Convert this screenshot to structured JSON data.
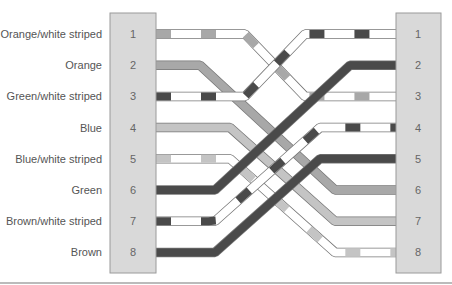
{
  "diagram": {
    "colors": {
      "connector_fill": "#d9d9d9",
      "connector_stroke": "#9a9a9a",
      "outline": "#777777",
      "white": "#ffffff",
      "orange": "#a8a8a8",
      "blue": "#c4c4c4",
      "green": "#4a4a4a",
      "brown": "#4a4a4a",
      "baseline": "#bbbbbb"
    },
    "left_labels": [
      "Orange/white striped",
      "Orange",
      "Green/white striped",
      "Blue",
      "Blue/white striped",
      "Green",
      "Brown/white striped",
      "Brown"
    ],
    "left_pins": [
      "1",
      "2",
      "3",
      "4",
      "5",
      "6",
      "7",
      "8"
    ],
    "right_pins": [
      "1",
      "2",
      "3",
      "4",
      "5",
      "6",
      "7",
      "8"
    ],
    "wires": [
      {
        "name": "Orange/white striped",
        "from": 1,
        "to": 3,
        "color": "orange",
        "striped": true
      },
      {
        "name": "Orange",
        "from": 2,
        "to": 6,
        "color": "orange",
        "striped": false
      },
      {
        "name": "Green/white striped",
        "from": 3,
        "to": 1,
        "color": "green",
        "striped": true
      },
      {
        "name": "Blue",
        "from": 4,
        "to": 7,
        "color": "blue",
        "striped": false
      },
      {
        "name": "Blue/white striped",
        "from": 5,
        "to": 8,
        "color": "blue",
        "striped": true
      },
      {
        "name": "Green",
        "from": 6,
        "to": 2,
        "color": "green",
        "striped": false
      },
      {
        "name": "Brown/white striped",
        "from": 7,
        "to": 4,
        "color": "brown",
        "striped": true
      },
      {
        "name": "Brown",
        "from": 8,
        "to": 5,
        "color": "brown",
        "striped": false
      }
    ]
  }
}
